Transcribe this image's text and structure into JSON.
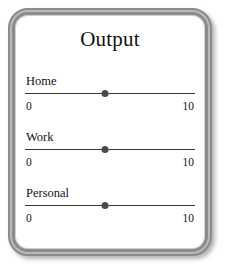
{
  "panel": {
    "title": "Output",
    "frame_color": "#8b8b8b",
    "background_color": "#ffffff",
    "text_color": "#111111"
  },
  "sliders": [
    {
      "label": "Home",
      "min_label": "0",
      "max_label": "10",
      "min": 0,
      "max": 10,
      "value": 5,
      "thumb_percent": 47,
      "thumb_color": "#4a4a4a",
      "track_color": "#3a3a3a"
    },
    {
      "label": "Work",
      "min_label": "0",
      "max_label": "10",
      "min": 0,
      "max": 10,
      "value": 5,
      "thumb_percent": 47,
      "thumb_color": "#4a4a4a",
      "track_color": "#3a3a3a"
    },
    {
      "label": "Personal",
      "min_label": "0",
      "max_label": "10",
      "min": 0,
      "max": 10,
      "value": 5,
      "thumb_percent": 47,
      "thumb_color": "#4a4a4a",
      "track_color": "#3a3a3a"
    }
  ]
}
